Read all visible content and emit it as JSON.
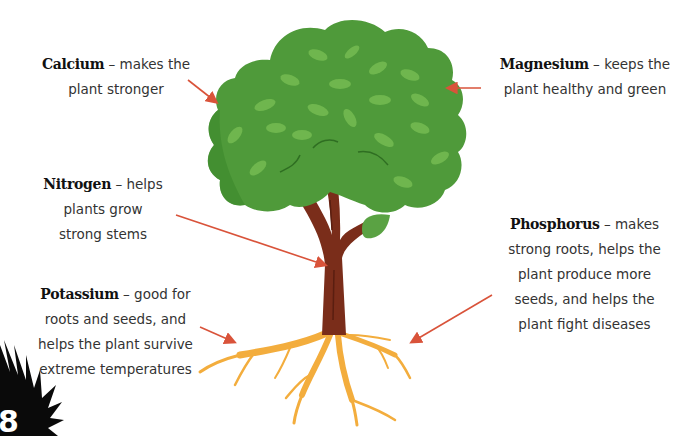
{
  "colors": {
    "arrow": "#d9533a",
    "foliage": "#4f9a3a",
    "foliage_dark": "#3f8a2e",
    "leaf_highlight": "#6fb64e",
    "trunk": "#7a2d1a",
    "roots": "#f3ad3d",
    "text": "#333333"
  },
  "labels": [
    {
      "id": "calcium",
      "term": "Calcium",
      "dash": " – ",
      "lines": [
        "makes the",
        "plant stronger"
      ]
    },
    {
      "id": "magnesium",
      "term": "Magnesium",
      "dash": " – ",
      "lines": [
        "keeps the",
        "plant healthy and green"
      ]
    },
    {
      "id": "nitrogen",
      "term": "Nitrogen",
      "dash": " – ",
      "lines": [
        "helps",
        "plants grow",
        "strong stems"
      ]
    },
    {
      "id": "potassium",
      "term": "Potassium",
      "dash": " – ",
      "lines": [
        "good for",
        "roots and seeds, and",
        "helps the plant survive",
        "extreme temperatures"
      ]
    },
    {
      "id": "phosphorus",
      "term": "Phosphorus",
      "dash": " – ",
      "lines": [
        "makes",
        "strong roots, helps the",
        "plant produce more",
        "seeds, and helps the",
        "plant fight diseases"
      ]
    }
  ],
  "page": {
    "number": "8"
  }
}
